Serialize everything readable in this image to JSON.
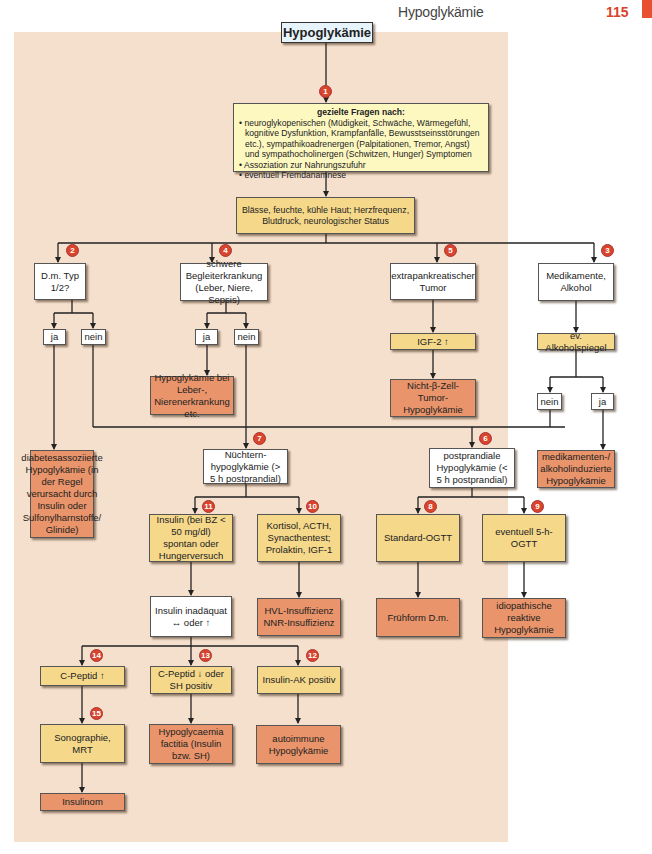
{
  "header": {
    "title": "Hypoglykämie",
    "page_number": "115",
    "accent_color": "#e8512f"
  },
  "diagram": {
    "title": "Hypoglykämie",
    "colors": {
      "background": "#f5dfcd",
      "white": "#ffffff",
      "yellow": "#f5d88a",
      "lightyellow": "#fdf8c0",
      "orange": "#e9946a",
      "badge": "#d9452c"
    },
    "intro": {
      "heading": "gezielte Fragen nach:",
      "items": [
        "• neuroglykopenischen (Müdigkeit, Schwäche, Wärmegefühl, kognitive Dysfunktion, Krampfanfälle, Bewusstseinsstörungen etc.), sympathikoadrenergen (Palpitationen, Tremor, Angst) und sympathocholinergen (Schwitzen, Hunger) Symptomen",
        "• Assoziation zur Nahrungszufuhr",
        "• eventuell Fremdanamnese"
      ]
    },
    "exam": "Blässe, feuchte, kühle Haut; Herzfrequenz, Blutdruck, neurologischer Status",
    "badges": {
      "b1": "1",
      "b2": "2",
      "b3": "3",
      "b4": "4",
      "b5": "5",
      "b6": "6",
      "b7": "7",
      "b8": "8",
      "b9": "9",
      "b10": "10",
      "b11": "11",
      "b12": "12",
      "b13": "13",
      "b14": "14",
      "b15": "15"
    },
    "nodes": {
      "dm": "D.m. Typ 1/2?",
      "begleit": "schwere Begleiterkrankung (Leber, Niere, Sepsis)",
      "extrapank": "extrapankreatischer Tumor",
      "medik": "Medikamente, Alkohol",
      "dm_ja": "ja",
      "dm_nein": "nein",
      "beg_ja": "ja",
      "beg_nein": "nein",
      "leber": "Hypoglykämie bei Leber-, Nierenerkrankung etc.",
      "igf2": "IGF-2 ↑",
      "nichtbeta": "Nicht-β-Zell-Tumor-Hypoglykämie",
      "alkspiegel": "ev. Alkoholspiegel",
      "alk_nein": "nein",
      "alk_ja": "ja",
      "diabetes": "diabetesassoziierte Hypoglykämie (in der Regel verursacht durch Insulin oder Sulfonylharnstoffe/ Glinide)",
      "nuechtern": "Nüchtern-hypoglykämie (> 5 h postprandial)",
      "postprandial": "postprandiale Hypoglykämie (< 5 h postprandial)",
      "medinduz": "medikamenten-/ alkoholinduzierte Hypoglykämie",
      "insulin": "Insulin (bei BZ < 50 mg/dl) spontan oder Hungerversuch",
      "kortisol": "Kortisol, ACTH, Synacthentest; Prolaktin, IGF-1",
      "standardogtt": "Standard-OGTT",
      "ogtt5": "eventuell 5-h-OGTT",
      "inadaequat": "Insulin inadäquat ↔ oder ↑",
      "hvl": "HVL-Insuffizienz NNR-Insuffizienz",
      "fruehform": "Frühform D.m.",
      "idiopath": "idiopathische reaktive Hypoglykämie",
      "cpeptid_up": "C-Peptid ↑",
      "cpeptid_down": "C-Peptid ↓ oder SH positiv",
      "insulinak": "Insulin-AK positiv",
      "sono": "Sonographie, MRT",
      "factitia": "Hypoglycaemia factitia (Insulin bzw. SH)",
      "autoimmun": "autoimmune Hypoglykämie",
      "insulinom": "Insulinom"
    }
  }
}
